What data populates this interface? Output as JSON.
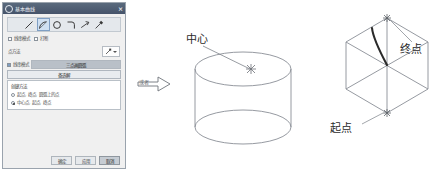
{
  "dialog": {
    "title": "基本曲线",
    "close_label": "×",
    "toolbar": {
      "tools": [
        {
          "name": "line-tool",
          "label": "直线"
        },
        {
          "name": "arc-tool",
          "label": "圆弧",
          "selected": true
        },
        {
          "name": "circle-tool",
          "label": "圆"
        },
        {
          "name": "fillet-tool",
          "label": "圆角"
        },
        {
          "name": "trim-tool",
          "label": "修剪"
        },
        {
          "name": "edit-tool",
          "label": "编辑"
        }
      ]
    },
    "checkbox_row": {
      "option1": {
        "label": "线串模式",
        "checked": false
      },
      "option2": {
        "label": "打断",
        "checked": false
      }
    },
    "method_row": {
      "label": "点方法",
      "button_label": "点构造器"
    },
    "mode_row": {
      "label": "线串模式",
      "checked": true
    },
    "tabs": [
      {
        "label": "三点画圆弧",
        "active": true
      },
      {
        "label": "备选解",
        "active": false
      }
    ],
    "options": {
      "group_label": "创建方法",
      "items": [
        {
          "label": "起点, 终点, 圆弧上的点",
          "selected": false
        },
        {
          "label": "中心点, 起点, 终点",
          "selected": true
        }
      ]
    },
    "footer": {
      "buttons": [
        {
          "label": "确定",
          "primary": false
        },
        {
          "label": "应用",
          "primary": false
        },
        {
          "label": "取消",
          "primary": true
        }
      ]
    }
  },
  "cylinder_diagram": {
    "arrow_label": "或者",
    "center_label": "中心",
    "center_marker": "✳"
  },
  "hexagon_diagram": {
    "end_label": "终点",
    "start_label": "起点"
  },
  "colors": {
    "title_bar": "#45536a",
    "accent": "#7f9fc4",
    "tab_active": "#b9c0c8",
    "geometry_stroke": "#8a8f96",
    "arc_stroke": "#2a2a2a"
  }
}
